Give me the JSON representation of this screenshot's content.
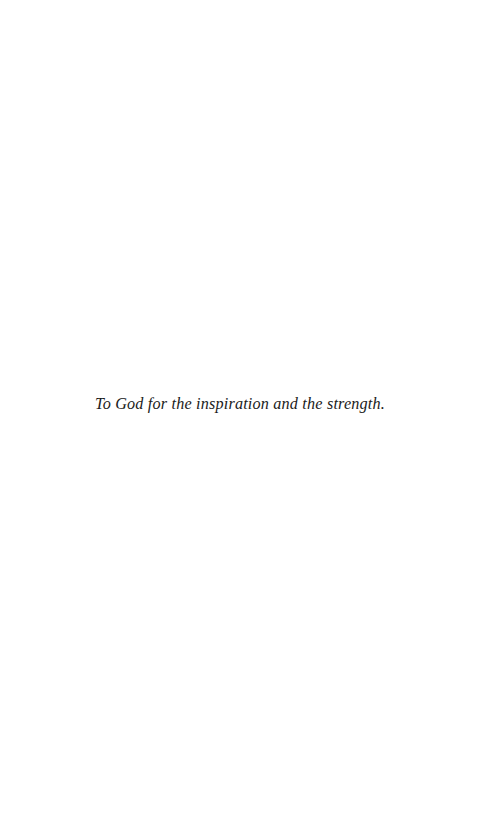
{
  "page": {
    "background_color": "#ffffff",
    "type": "book-dedication-page"
  },
  "dedication": {
    "text": "To God for the inspiration and the strength.",
    "color": "#1b1b1b",
    "style": "italic-serif"
  }
}
